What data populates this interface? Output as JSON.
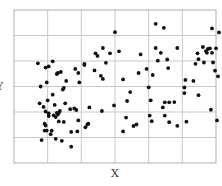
{
  "chart_data": {
    "type": "scatter",
    "title": "",
    "xlabel": "X",
    "ylabel": "Y",
    "xlim": [
      0,
      6
    ],
    "ylim": [
      0,
      6
    ],
    "grid": true,
    "grid_divisions": {
      "x": 6,
      "y": 6
    },
    "xticks": [],
    "yticks": [],
    "legend": null,
    "colors": {
      "point": "#111111",
      "grid": "#c8c8c8",
      "frame": "#b0b0b0",
      "background": "#ffffff"
    },
    "points": [
      [
        0.71,
        3.91
      ],
      [
        0.76,
        2.34
      ],
      [
        0.79,
        3.0
      ],
      [
        0.82,
        0.9
      ],
      [
        0.88,
        2.2
      ],
      [
        0.94,
        3.74
      ],
      [
        0.94,
        2.02
      ],
      [
        0.91,
        1.27
      ],
      [
        0.91,
        1.54
      ],
      [
        0.94,
        1.47
      ],
      [
        0.97,
        3.16
      ],
      [
        0.97,
        1.27
      ],
      [
        1.0,
        2.46
      ],
      [
        1.03,
        3.79
      ],
      [
        1.03,
        1.94
      ],
      [
        1.03,
        1.84
      ],
      [
        1.09,
        1.13
      ],
      [
        1.12,
        1.27
      ],
      [
        1.15,
        3.99
      ],
      [
        1.15,
        2.68
      ],
      [
        1.18,
        1.87
      ],
      [
        1.21,
        2.28
      ],
      [
        1.24,
        0.95
      ],
      [
        1.24,
        1.8
      ],
      [
        1.27,
        3.49
      ],
      [
        1.27,
        1.97
      ],
      [
        1.3,
        3.53
      ],
      [
        1.3,
        1.9
      ],
      [
        1.33,
        1.63
      ],
      [
        1.33,
        1.97
      ],
      [
        1.36,
        2.04
      ],
      [
        1.39,
        3.57
      ],
      [
        1.42,
        0.87
      ],
      [
        1.45,
        2.88
      ],
      [
        1.48,
        2.95
      ],
      [
        1.48,
        1.61
      ],
      [
        1.52,
        2.34
      ],
      [
        1.55,
        3.22
      ],
      [
        1.67,
        2.11
      ],
      [
        1.7,
        0.64
      ],
      [
        1.7,
        1.22
      ],
      [
        1.79,
        2.14
      ],
      [
        1.82,
        3.69
      ],
      [
        1.85,
        2.08
      ],
      [
        1.88,
        1.24
      ],
      [
        1.91,
        1.67
      ],
      [
        1.91,
        3.53
      ],
      [
        2.09,
        3.89
      ],
      [
        2.09,
        3.84
      ],
      [
        2.12,
        1.4
      ],
      [
        2.18,
        1.51
      ],
      [
        2.21,
        1.54
      ],
      [
        2.24,
        2.18
      ],
      [
        2.42,
        4.3
      ],
      [
        2.48,
        4.2
      ],
      [
        2.58,
        3.42
      ],
      [
        2.61,
        2.04
      ],
      [
        2.64,
        4.51
      ],
      [
        2.64,
        3.3
      ],
      [
        2.73,
        3.93
      ],
      [
        2.85,
        4.3
      ],
      [
        2.97,
        2.26
      ],
      [
        3.0,
        5.13
      ],
      [
        3.12,
        4.38
      ],
      [
        3.24,
        3.28
      ],
      [
        3.24,
        1.24
      ],
      [
        3.33,
        1.78
      ],
      [
        3.36,
        2.43
      ],
      [
        3.45,
        2.78
      ],
      [
        3.55,
        1.45
      ],
      [
        3.64,
        1.51
      ],
      [
        3.7,
        3.53
      ],
      [
        3.76,
        4.26
      ],
      [
        3.94,
        3.69
      ],
      [
        4.0,
        2.97
      ],
      [
        4.06,
        2.46
      ],
      [
        4.03,
        1.86
      ],
      [
        4.09,
        1.64
      ],
      [
        4.12,
        3.45
      ],
      [
        4.21,
        5.46
      ],
      [
        4.21,
        4.51
      ],
      [
        4.36,
        4.32
      ],
      [
        4.42,
        2.18
      ],
      [
        4.45,
        5.3
      ],
      [
        4.48,
        2.38
      ],
      [
        4.48,
        1.86
      ],
      [
        4.55,
        4.06
      ],
      [
        4.58,
        3.72
      ],
      [
        4.61,
        1.6
      ],
      [
        4.76,
        2.39
      ],
      [
        4.85,
        1.46
      ],
      [
        4.85,
        4.51
      ],
      [
        5.06,
        2.74
      ],
      [
        5.06,
        2.96
      ],
      [
        5.09,
        3.26
      ],
      [
        5.12,
        1.62
      ],
      [
        5.33,
        3.22
      ],
      [
        5.39,
        3.89
      ],
      [
        5.48,
        2.66
      ],
      [
        5.48,
        4.07
      ],
      [
        5.61,
        4.55
      ],
      [
        5.64,
        3.94
      ],
      [
        5.7,
        4.39
      ],
      [
        5.73,
        4.32
      ],
      [
        5.76,
        4.47
      ],
      [
        5.82,
        4.5
      ],
      [
        5.88,
        5.28
      ],
      [
        5.85,
        2.09
      ],
      [
        5.88,
        4.32
      ],
      [
        5.91,
        3.94
      ],
      [
        5.97,
        3.62
      ],
      [
        6.0,
        4.5
      ],
      [
        6.03,
        1.67
      ],
      [
        6.06,
        3.4
      ],
      [
        6.09,
        5.12
      ],
      [
        4.61,
        2.38
      ],
      [
        2.39,
        3.63
      ],
      [
        1.94,
        3.16
      ],
      [
        4.27,
        4.01
      ],
      [
        5.45,
        4.3
      ]
    ]
  }
}
